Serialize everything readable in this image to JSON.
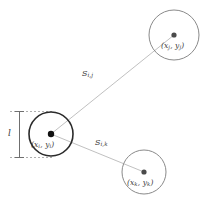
{
  "diagram": {
    "type": "geometry-node-distance-diagram",
    "background_color": "#ffffff",
    "nodes": [
      {
        "id": "node-i",
        "label": "(xᵢ, yᵢ)",
        "label_base": "(x",
        "sub_1": "i",
        "label_mid": ", y",
        "sub_2": "i",
        "label_end": ")",
        "cx": 51,
        "cy": 134,
        "r": 22,
        "emphasis": true,
        "stroke_color": "#2b2b2b"
      },
      {
        "id": "node-j",
        "label": "(xⱼ, yⱼ)",
        "label_base": "(x",
        "sub_1": "j",
        "label_mid": ", y",
        "sub_2": "j",
        "label_end": ")",
        "cx": 174,
        "cy": 35,
        "r": 25,
        "emphasis": false,
        "stroke_color": "#8a8a8a"
      },
      {
        "id": "node-k",
        "label": "(xₖ, yₖ)",
        "label_base": "(x",
        "sub_1": "k",
        "label_mid": ", y",
        "sub_2": "k",
        "label_end": ")",
        "cx": 144,
        "cy": 172,
        "r": 22,
        "emphasis": false,
        "stroke_color": "#8a8a8a"
      }
    ],
    "edges": [
      {
        "id": "edge-ij",
        "from": "node-i",
        "to": "node-j",
        "label_base": "S",
        "label_sub": "i,j",
        "label_full": "Sᵢ,ⱼ",
        "label_x": 82,
        "label_y": 69
      },
      {
        "id": "edge-ik",
        "from": "node-i",
        "to": "node-k",
        "label_base": "S",
        "label_sub": "i,k",
        "label_full": "Sᵢ,ₖ",
        "label_x": 95,
        "label_y": 138
      }
    ],
    "dimension": {
      "id": "diameter-marker",
      "label": "l",
      "label_x": 8,
      "label_y": 128,
      "line_x": 19,
      "top_y": 111,
      "bottom_y": 158,
      "tick_x_start": 10,
      "tick_x_end": 52
    }
  }
}
